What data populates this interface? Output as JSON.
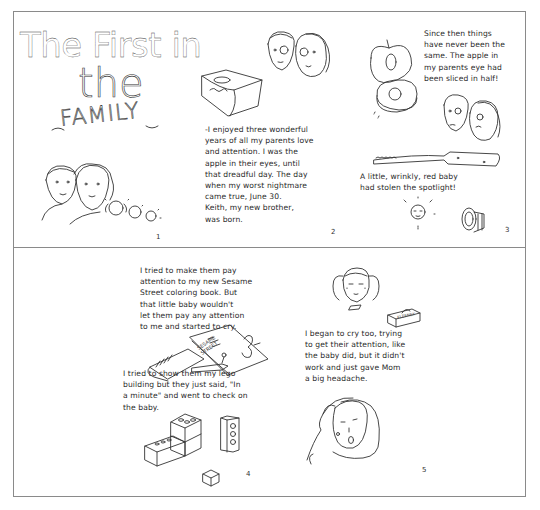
{
  "comic": {
    "title": {
      "line1": "The First in",
      "line2": "the",
      "line3": "FAMILY"
    },
    "panels": [
      {
        "number": "1",
        "text": "",
        "illustration": "family-portrait: father, mother, girl with pigtails, boy, baby"
      },
      {
        "number": "2",
        "text": "-I enjoyed three wonderful\nyears of all my parents love\nand attention. I was the\napple in their eyes, until\nthat dreadful day. The day\nwhen my worst nightmare\ncame true, June 30.\nKeith, my new brother,\nwas born.",
        "illustration": "bassinet with baby and parents' faces"
      },
      {
        "number": "3",
        "text_top": "Since then things\nhave never been the\nsame. The apple in\nmy parents eye had\nbeen sliced in half!",
        "text_bottom": "A little, wrinkly, red baby\nhad stolen the spotlight!",
        "illustration": "sliced apple, parents, knife, baby, spotlight"
      },
      {
        "number": "4",
        "text_top": "I tried to make them pay\nattention to my new Sesame\nStreet coloring book. But\nthat little baby wouldn't\nlet them pay any attention\nto me and started to cry.",
        "text_bottom": "I tried to show them my lego\nbuilding but they just said, \"In\na minute\" and went to check on\nthe baby.",
        "book_label": "SESAME STREET",
        "crayon_label": "CRAYONS",
        "illustration": "crayon box, coloring book, lego bricks"
      },
      {
        "number": "5",
        "text": "I began to cry too, trying\nto get their attention, like\nthe baby did, but it didn't\nwork and just gave Mom\na big headache.",
        "tissue_label": "KLEENEX",
        "illustration": "crying girl, tissue box, mom holding head"
      }
    ]
  }
}
